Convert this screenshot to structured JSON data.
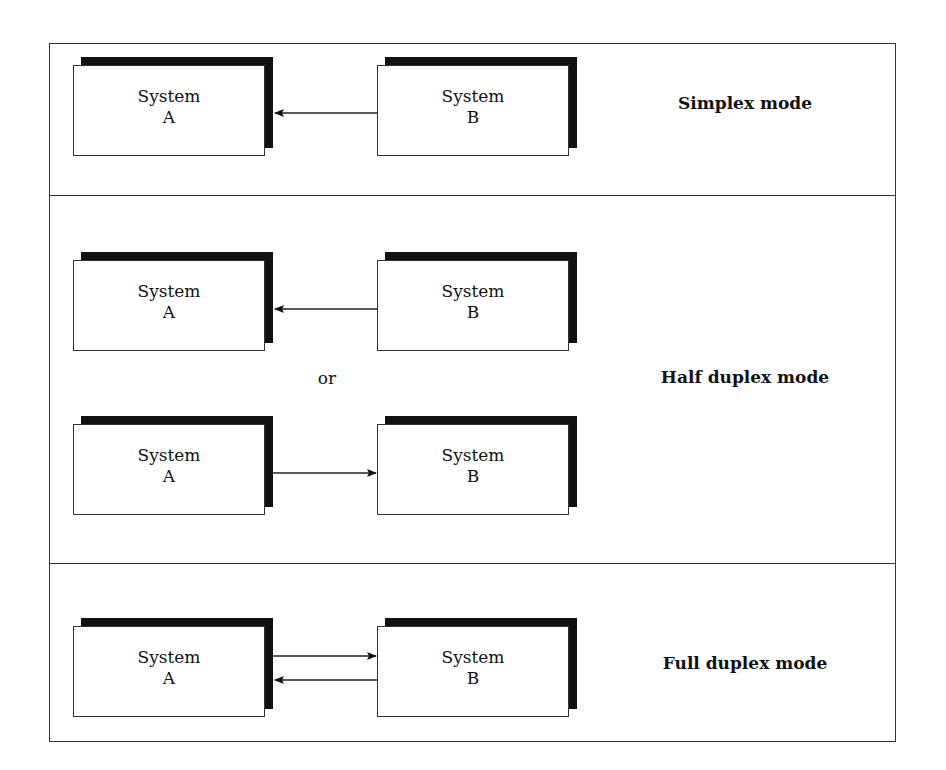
{
  "diagram": {
    "title_hidden": "",
    "panels": [
      {
        "id": "simplex",
        "label": "Simplex mode",
        "rows": [
          {
            "left": {
              "line1": "System",
              "line2": "A"
            },
            "right": {
              "line1": "System",
              "line2": "B"
            },
            "arrows": [
              "B→A"
            ]
          }
        ]
      },
      {
        "id": "half-duplex",
        "label": "Half duplex mode",
        "separator": "or",
        "rows": [
          {
            "left": {
              "line1": "System",
              "line2": "A"
            },
            "right": {
              "line1": "System",
              "line2": "B"
            },
            "arrows": [
              "B→A"
            ]
          },
          {
            "left": {
              "line1": "System",
              "line2": "A"
            },
            "right": {
              "line1": "System",
              "line2": "B"
            },
            "arrows": [
              "A→B"
            ]
          }
        ]
      },
      {
        "id": "full-duplex",
        "label": "Full duplex mode",
        "rows": [
          {
            "left": {
              "line1": "System",
              "line2": "A"
            },
            "right": {
              "line1": "System",
              "line2": "B"
            },
            "arrows": [
              "A→B",
              "B→A"
            ]
          }
        ]
      }
    ],
    "colors": {
      "line": "#333333",
      "shadow": "#111111",
      "background": "#ffffff"
    }
  }
}
